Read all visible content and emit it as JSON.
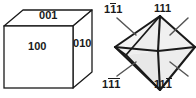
{
  "figure": {
    "background_color": "#ffffff",
    "line_color": "#1a1a1a",
    "text_color": "#1a1a1a"
  },
  "cube": {
    "name": "cube-diagram",
    "face_fill": "#ffffff",
    "top_face_fill": "#ffffff",
    "right_face_fill": "#ffffff",
    "labels": {
      "top": {
        "digits": "001",
        "d1": "0",
        "d2": "0",
        "d3": "1"
      },
      "front": {
        "digits": "100",
        "d1": "1",
        "d2": "0",
        "d3": "0"
      },
      "right": {
        "digits": "010",
        "d1": "0",
        "d2": "1",
        "d3": "0"
      }
    }
  },
  "octahedron": {
    "name": "octahedron-diagram",
    "face_fill_light": "#f2f2f2",
    "face_fill_mid": "#e6e6e6",
    "labels": {
      "top_left": {
        "d1": "1",
        "d2": "1",
        "d3": "1",
        "bar1": false,
        "bar2": true,
        "bar3": false
      },
      "top_right": {
        "d1": "1",
        "d2": "1",
        "d3": "1",
        "bar1": false,
        "bar2": false,
        "bar3": false
      },
      "bottom_left": {
        "d1": "1",
        "d2": "1",
        "d3": "1",
        "bar1": false,
        "bar2": true,
        "bar3": true
      },
      "bottom_right": {
        "d1": "1",
        "d2": "1",
        "d3": "1",
        "bar1": false,
        "bar2": false,
        "bar3": true
      }
    }
  }
}
